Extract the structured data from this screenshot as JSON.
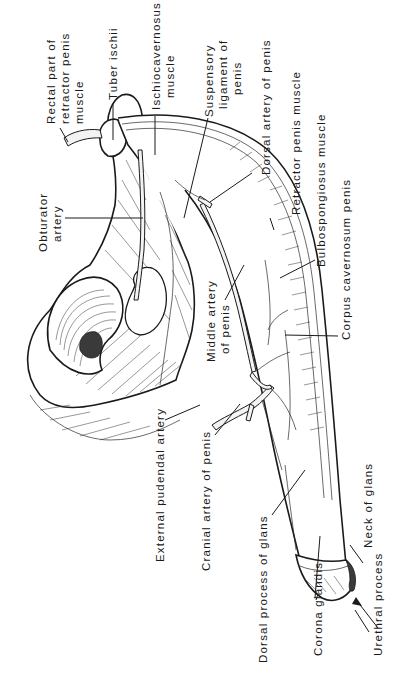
{
  "figure": {
    "orientation": "rotated 90 degrees counter-clockwise",
    "labels": [
      {
        "id": "rectal-part-retractor",
        "lines": [
          "Rectal part of",
          "retractor penis",
          "muscle"
        ]
      },
      {
        "id": "tuber-ischii",
        "lines": [
          "Tuber ischii"
        ]
      },
      {
        "id": "ischiocavernosus",
        "lines": [
          "Ischiocavernosus",
          "muscle"
        ]
      },
      {
        "id": "suspensory-ligament",
        "lines": [
          "Suspensory",
          "ligament of",
          "penis"
        ]
      },
      {
        "id": "dorsal-artery",
        "lines": [
          "Dorsal artery of penis"
        ]
      },
      {
        "id": "retractor-penis",
        "lines": [
          "Retractor penis muscle"
        ]
      },
      {
        "id": "bulbospongiosus",
        "lines": [
          "Bulbospongiosus muscle"
        ]
      },
      {
        "id": "corpus-cavernosum",
        "lines": [
          "Corpus cavernosum penis"
        ]
      },
      {
        "id": "obturator-artery",
        "lines": [
          "Obturator",
          "artery"
        ]
      },
      {
        "id": "middle-artery",
        "lines": [
          "Middle artery",
          "of penis"
        ]
      },
      {
        "id": "external-pudendal",
        "lines": [
          "External pudendal artery"
        ]
      },
      {
        "id": "cranial-artery",
        "lines": [
          "Cranial artery of penis"
        ]
      },
      {
        "id": "dorsal-process-glans",
        "lines": [
          "Dorsal process of glans"
        ]
      },
      {
        "id": "corona-glandis",
        "lines": [
          "Corona glandis"
        ]
      },
      {
        "id": "urethral-process",
        "lines": [
          "Urethral process"
        ]
      },
      {
        "id": "neck-of-glans",
        "lines": [
          "Neck of glans"
        ]
      }
    ]
  }
}
